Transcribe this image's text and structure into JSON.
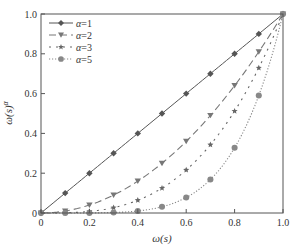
{
  "chart_data": {
    "type": "line",
    "title": "",
    "xlabel": "ω(s)",
    "ylabel": "ω(s)^α",
    "xlim": [
      0,
      1.0
    ],
    "ylim": [
      0,
      1.0
    ],
    "xticks": [
      "0",
      "0.2",
      "0.4",
      "0.6",
      "0.8",
      "1.0"
    ],
    "yticks": [
      "0",
      "0.2",
      "0.4",
      "0.6",
      "0.8",
      "1.0"
    ],
    "grid": false,
    "legend_position": "upper left",
    "x": [
      0,
      0.1,
      0.2,
      0.3,
      0.4,
      0.5,
      0.6,
      0.7,
      0.8,
      0.9,
      1.0
    ],
    "series": [
      {
        "name": "α=1",
        "line": "solid",
        "marker": "diamond",
        "color": "#555555",
        "values": [
          0,
          0.1,
          0.2,
          0.3,
          0.4,
          0.5,
          0.6,
          0.7,
          0.8,
          0.9,
          1.0
        ]
      },
      {
        "name": "α=2",
        "line": "dashed",
        "marker": "triangle-down",
        "color": "#777777",
        "values": [
          0,
          0.01,
          0.04,
          0.09,
          0.16,
          0.25,
          0.36,
          0.49,
          0.64,
          0.81,
          1.0
        ]
      },
      {
        "name": "α=3",
        "line": "dashdot",
        "marker": "star",
        "color": "#666666",
        "values": [
          0,
          0.001,
          0.008,
          0.027,
          0.064,
          0.125,
          0.216,
          0.343,
          0.512,
          0.729,
          1.0
        ]
      },
      {
        "name": "α=5",
        "line": "dotted",
        "marker": "circle",
        "color": "#888888",
        "values": [
          0,
          1e-05,
          0.00032,
          0.00243,
          0.01024,
          0.03125,
          0.07776,
          0.16807,
          0.32768,
          0.59049,
          1.0
        ]
      }
    ]
  }
}
